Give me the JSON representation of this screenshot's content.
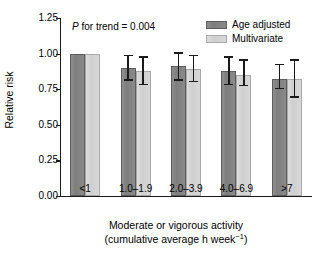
{
  "chart_data": {
    "type": "bar",
    "title": "",
    "xlabel": "Moderate or vigorous activity",
    "xlabel_line2": "(cumulative average h week−1)",
    "xlabel_line2_prefix": "(cumulative average h week",
    "xlabel_line2_sup": "−1",
    "xlabel_line2_suffix": ")",
    "ylabel": "Relative risk",
    "ylim": [
      0.0,
      1.25
    ],
    "yticks": [
      0.0,
      0.25,
      0.5,
      0.75,
      1.0,
      1.25
    ],
    "ytick_labels": [
      "0.00",
      "0.25",
      "0.50",
      "0.75",
      "1.00",
      "1.25"
    ],
    "grid": false,
    "legend_position": "top-right",
    "categories": [
      "<1",
      "1.0–1.9",
      "2.0–3.9",
      "4.0–6.9",
      ">7"
    ],
    "series": [
      {
        "name": "Age adjusted",
        "color": "#808080",
        "values": [
          1.0,
          0.9,
          0.91,
          0.88,
          0.82
        ],
        "ci_low": [
          null,
          0.81,
          0.81,
          0.78,
          0.75
        ],
        "ci_high": [
          null,
          0.99,
          1.01,
          0.98,
          0.93
        ]
      },
      {
        "name": "Multivariate",
        "color": "#d4d4d4",
        "values": [
          1.0,
          0.88,
          0.89,
          0.85,
          0.82
        ],
        "ci_low": [
          null,
          0.78,
          0.8,
          0.77,
          0.69
        ],
        "ci_high": [
          null,
          0.98,
          0.99,
          0.96,
          0.96
        ]
      }
    ],
    "annotations": [
      {
        "name": "p-for-trend",
        "text_italic": "P",
        "text": " for trend = 0.004"
      }
    ]
  },
  "legend": {
    "items": [
      {
        "label": "Age adjusted",
        "swatch": "dark"
      },
      {
        "label": "Multivariate",
        "swatch": "light"
      }
    ]
  }
}
